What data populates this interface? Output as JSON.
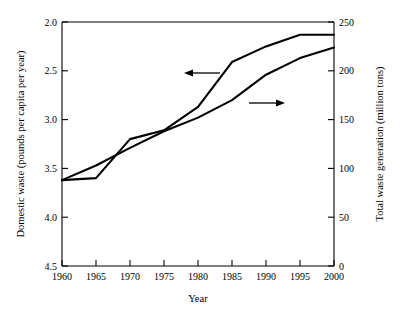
{
  "chart_data": {
    "type": "line",
    "title": "",
    "xlabel": "Year",
    "ylabel": "Domestic waste (pounds per capita per year)",
    "y2label": "Total waste generation (million tons)",
    "x": [
      1960,
      1965,
      1970,
      1975,
      1980,
      1985,
      1990,
      1995,
      2000
    ],
    "xlim": [
      1960,
      2000
    ],
    "xticks": [
      1960,
      1965,
      1970,
      1975,
      1980,
      1985,
      1990,
      1995,
      2000
    ],
    "xtick_labels": [
      "1960",
      "1965",
      "1970",
      "1975",
      "1980",
      "1985",
      "1990",
      "1995",
      "2000"
    ],
    "ylim": [
      2.0,
      4.5
    ],
    "yticks": [
      2.0,
      2.5,
      3.0,
      3.5,
      4.0,
      4.5
    ],
    "ytick_labels": [
      "2.0",
      "2.5",
      "3.0",
      "3.5",
      "4.0",
      "4.5"
    ],
    "y2lim": [
      0,
      250
    ],
    "y2ticks": [
      0,
      50,
      100,
      150,
      200,
      250
    ],
    "y2tick_labels": [
      "0",
      "50",
      "100",
      "150",
      "200",
      "250"
    ],
    "grid": false,
    "legend": "none",
    "series": [
      {
        "name": "Domestic waste (pounds per capita per year)",
        "axis": "left",
        "color": "#000000",
        "values": [
          2.88,
          2.9,
          3.3,
          3.39,
          3.63,
          4.09,
          4.25,
          4.37,
          4.37
        ]
      },
      {
        "name": "Total waste generation (million tons)",
        "axis": "right",
        "color": "#000000",
        "values": [
          88,
          103,
          121,
          138,
          152,
          170,
          196,
          213,
          224
        ]
      }
    ],
    "annotations": [
      {
        "name": "left-axis-pointer",
        "text": "",
        "direction": "left",
        "x_data": 1982.5,
        "y_data": 3.935,
        "refers_to": "Domestic waste (pounds per capita per year)"
      },
      {
        "name": "right-axis-pointer",
        "text": "",
        "direction": "right",
        "x_data": 1989.5,
        "y_data": 3.78,
        "refers_to": "Total waste generation (million tons)"
      }
    ]
  }
}
